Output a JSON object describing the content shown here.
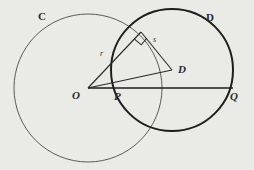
{
  "figure": {
    "type": "geometry-diagram",
    "background_color": "#eaeae7",
    "ink_color": "#2a2a2a",
    "labels": {
      "circle_c": "C",
      "circle_d": "D",
      "center_o": "O",
      "center_d": "D",
      "point_p": "P",
      "point_q": "Q",
      "segment_r": "r",
      "segment_s": "s"
    },
    "circles": [
      {
        "name": "C",
        "label": "C",
        "center_label": "O",
        "cx": 88,
        "cy": 88,
        "r": 74,
        "stroke_width": 0.9,
        "color": "#4a4a4a"
      },
      {
        "name": "D",
        "label": "D",
        "center_label": "D",
        "cx": 172,
        "cy": 70,
        "r": 61,
        "stroke_width": 2.0,
        "color": "#1e1e1e"
      }
    ],
    "points": [
      {
        "name": "O",
        "label": "O",
        "x": 88,
        "y": 88
      },
      {
        "name": "P",
        "label": "P",
        "x": 126,
        "y": 88
      },
      {
        "name": "Q",
        "label": "Q",
        "x": 233,
        "y": 88
      },
      {
        "name": "D",
        "label": "D",
        "x": 172,
        "y": 70
      },
      {
        "name": "T",
        "label": "",
        "x": 141,
        "y": 32
      }
    ],
    "segments": [
      {
        "name": "OT",
        "label": "r",
        "from": "O",
        "to": "T"
      },
      {
        "name": "TD",
        "label": "s",
        "from": "T",
        "to": "D"
      },
      {
        "name": "OD",
        "label": "",
        "from": "O",
        "to": "D"
      },
      {
        "name": "OQ",
        "label": "",
        "from": "O",
        "to": "Q"
      }
    ],
    "right_angle": {
      "at": "T",
      "size": 9,
      "marker": "square"
    },
    "label_positions": {
      "circle_c": {
        "x": 38,
        "y": 11
      },
      "circle_d": {
        "x": 206,
        "y": 12
      },
      "center_o": {
        "x": 72,
        "y": 90
      },
      "center_d": {
        "x": 178,
        "y": 64
      },
      "point_p": {
        "x": 114,
        "y": 91
      },
      "point_q": {
        "x": 230,
        "y": 91
      },
      "segment_r": {
        "x": 100,
        "y": 50
      },
      "segment_s": {
        "x": 153,
        "y": 36
      }
    }
  }
}
